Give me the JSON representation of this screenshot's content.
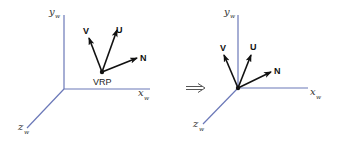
{
  "diagram": {
    "colors": {
      "axis": "#6b78b8",
      "vector": "#111111",
      "background": "#ffffff"
    },
    "left_frame": {
      "axes": {
        "y_label": "y",
        "y_sub": "w",
        "x_label": "x",
        "x_sub": "w",
        "z_label": "z",
        "z_sub": "w"
      },
      "vectors": {
        "v_label": "V",
        "u_label": "U",
        "n_label": "N"
      },
      "origin_label": "VRP"
    },
    "transition": {
      "symbol": "implies-arrow"
    },
    "right_frame": {
      "axes": {
        "y_label": "y",
        "y_sub": "w",
        "x_label": "x",
        "x_sub": "w",
        "z_label": "z",
        "z_sub": "w"
      },
      "vectors": {
        "v_label": "V",
        "u_label": "U",
        "n_label": "N"
      }
    }
  }
}
